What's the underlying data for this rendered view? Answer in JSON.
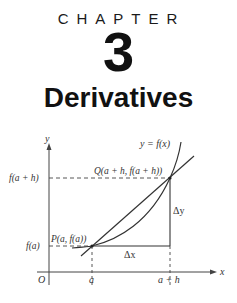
{
  "header": {
    "chapter_label": "CHAPTER",
    "chapter_number": "3",
    "chapter_title": "Derivatives"
  },
  "figure": {
    "curve_label": "y = f(x)",
    "y_axis_label": "y",
    "x_axis_label": "x",
    "origin_label": "O",
    "point_p_label": "P(a, f(a))",
    "point_q_label": "Q(a + h, f(a + h))",
    "y_tick_upper": "f(a + h)",
    "y_tick_lower": "f(a)",
    "x_tick_left": "a",
    "x_tick_right": "a + h",
    "delta_x_label": "Δx",
    "delta_y_label": "Δy"
  }
}
